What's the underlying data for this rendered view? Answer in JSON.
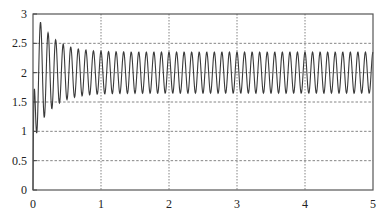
{
  "chart_data": {
    "type": "line",
    "title": "",
    "xlabel": "",
    "ylabel": "",
    "xlim": [
      0,
      5
    ],
    "ylim": [
      0,
      3
    ],
    "x_ticks": [
      0,
      1,
      2,
      3,
      4,
      5
    ],
    "x_tick_labels": [
      "0",
      "1",
      "2",
      "3",
      "4",
      "5"
    ],
    "y_ticks": [
      0,
      0.5,
      1,
      1.5,
      2,
      2.5,
      3
    ],
    "y_tick_labels": [
      "0",
      "0.5",
      "1",
      "1.5",
      "2",
      "2.5",
      "3"
    ],
    "grid": true,
    "legend": null,
    "series": [
      {
        "name": "response",
        "description": "Damped oscillatory response: rises from 0 to an overshoot peak of ~3.0 at t~0.08, then oscillates at ~9 cycles per unit around a mean of 2.0, settling to a sustained oscillation between ~1.65 and ~2.35",
        "model": {
          "mean": 2.0,
          "initial_peak": 3.0,
          "steady_amplitude": 0.35,
          "frequency": 9.0,
          "decay_rate": 4.0
        },
        "key_points": [
          {
            "x": 0.0,
            "y": 0.0
          },
          {
            "x": 0.08,
            "y": 3.0
          },
          {
            "x": 0.15,
            "y": 1.25
          },
          {
            "x": 0.22,
            "y": 2.6
          },
          {
            "x": 0.28,
            "y": 1.5
          },
          {
            "x": 0.35,
            "y": 2.55
          },
          {
            "x": 0.5,
            "y": 2.45
          },
          {
            "x": 1.0,
            "y": 2.38
          },
          {
            "x": 2.0,
            "y": 2.35
          },
          {
            "x": 3.0,
            "y": 2.35
          },
          {
            "x": 4.0,
            "y": 2.35
          },
          {
            "x": 5.0,
            "y": 2.35
          }
        ]
      }
    ]
  }
}
